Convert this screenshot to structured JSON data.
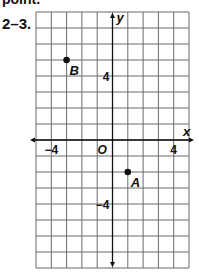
{
  "header": {
    "partial_text": "point.",
    "problem_number": "2–3."
  },
  "plane": {
    "x_range": [
      -5,
      5
    ],
    "y_range": [
      -8,
      8
    ],
    "grid_step": 1,
    "x_axis_label": "x",
    "y_axis_label": "y",
    "origin_label": "O",
    "tick_labels": [
      {
        "axis": "x",
        "value": -4,
        "text": "−4"
      },
      {
        "axis": "x",
        "value": 4,
        "text": "4"
      },
      {
        "axis": "y",
        "value": 4,
        "text": "4"
      },
      {
        "axis": "y",
        "value": -4,
        "text": "−4"
      }
    ],
    "points": [
      {
        "name": "B",
        "x": -3,
        "y": 5
      },
      {
        "name": "A",
        "x": 1,
        "y": -2
      }
    ]
  },
  "colors": {
    "grid": "#6b6b6b",
    "axis": "#111111",
    "point": "#111111"
  }
}
